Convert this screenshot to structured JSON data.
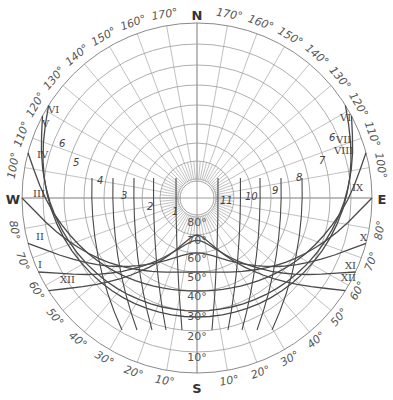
{
  "diagram": {
    "type": "sun-path-diagram",
    "cardinals": {
      "north": "N",
      "south": "S",
      "east": "E",
      "west": "W"
    },
    "altitude_rings_deg": [
      10,
      20,
      30,
      40,
      50,
      60,
      70,
      80
    ],
    "altitude_labels": [
      "10°",
      "20°",
      "30°",
      "40°",
      "50°",
      "60°",
      "70°",
      "80°"
    ],
    "azimuth_spoke_step_deg": 10,
    "azimuth_labels_north": [
      "170°",
      "160°",
      "150°",
      "140°",
      "130°",
      "120°",
      "110°",
      "100°"
    ],
    "azimuth_labels_south": [
      "80°",
      "70°",
      "60°",
      "50°",
      "40°",
      "30°",
      "20°",
      "10°"
    ],
    "month_labels_west": [
      "VI",
      "V",
      "IV",
      "III",
      "II",
      "I",
      "XII"
    ],
    "month_labels_east": [
      "VI",
      "VII",
      "VIII",
      "IX",
      "X",
      "XI",
      "XII"
    ],
    "hour_labels_morning": [
      "6",
      "5",
      "4",
      "3",
      "2",
      "1"
    ],
    "hour_labels_afternoon": [
      "11",
      "10",
      "9",
      "8",
      "7",
      "6"
    ],
    "date_curves": [
      {
        "months_west": "VI",
        "months_east": "VI",
        "max_altitude_deg": 70
      },
      {
        "months_west": "V",
        "months_east": "VII",
        "max_altitude_deg": 67
      },
      {
        "months_west": "IV",
        "months_east": "VIII",
        "max_altitude_deg": 60
      },
      {
        "months_west": "III",
        "months_east": "IX",
        "max_altitude_deg": 50
      },
      {
        "months_west": "II",
        "months_east": "X",
        "max_altitude_deg": 40
      },
      {
        "months_west": "I",
        "months_east": "XI",
        "max_altitude_deg": 30
      },
      {
        "months_west": "XII",
        "months_east": "XII",
        "max_altitude_deg": 27
      }
    ]
  }
}
